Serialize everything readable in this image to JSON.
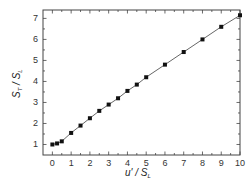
{
  "chart_data": {
    "type": "line",
    "title": "",
    "xlabel": "u' / S_L",
    "ylabel": "S_T / S_L",
    "xlabel_parts": {
      "main": "u' / S",
      "sub": "L"
    },
    "ylabel_parts": {
      "main1": "S",
      "sub1": "T",
      "mid": " / S",
      "sub2": "L"
    },
    "xlim": [
      -0.5,
      10
    ],
    "ylim": [
      0.5,
      7.4
    ],
    "xticks": [
      0,
      1,
      2,
      3,
      4,
      5,
      6,
      7,
      8,
      9,
      10
    ],
    "yticks": [
      1,
      2,
      3,
      4,
      5,
      6,
      7
    ],
    "grid": false,
    "legend": null,
    "series": [
      {
        "name": "S_T/S_L",
        "marker": "square",
        "color": "#111111",
        "x": [
          0,
          0.25,
          0.5,
          1,
          1.5,
          2,
          2.5,
          3,
          3.5,
          4,
          4.5,
          5,
          6,
          7,
          8,
          9,
          10
        ],
        "y": [
          1.0,
          1.05,
          1.15,
          1.55,
          1.9,
          2.25,
          2.6,
          2.9,
          3.2,
          3.55,
          3.85,
          4.2,
          4.8,
          5.4,
          6.0,
          6.6,
          7.15
        ]
      }
    ]
  },
  "colors": {
    "axis": "#444444",
    "line": "#555555",
    "marker": "#111111"
  }
}
